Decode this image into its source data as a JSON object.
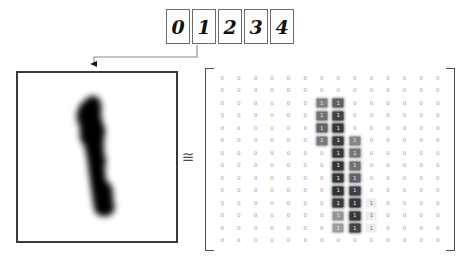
{
  "figure": {
    "approx_symbol": "≅"
  },
  "digit_strip": {
    "name": "digit-samples-strip",
    "digits": [
      {
        "label": "0",
        "selected": false
      },
      {
        "label": "1",
        "selected": true
      },
      {
        "label": "2",
        "selected": false
      },
      {
        "label": "3",
        "selected": false
      },
      {
        "label": "4",
        "selected": false
      }
    ]
  },
  "image_panel": {
    "name": "enlarged-digit-image",
    "depicted_digit": "1",
    "border_color": "#3a3a3a",
    "background_color": "#ffffff",
    "ink_color": "#000000"
  },
  "matrix": {
    "name": "pixel-intensity-matrix",
    "rows": 14,
    "cols": 14,
    "zero_label": "0",
    "one_label": "1",
    "bracket_color": "#4e4e5a",
    "zero_text_color": "#9a9aa2",
    "values": [
      [
        0,
        0,
        0,
        0,
        0,
        0,
        0,
        0,
        0,
        0,
        0,
        0,
        0,
        0
      ],
      [
        0,
        0,
        0,
        0,
        0,
        0,
        0,
        0,
        0,
        0,
        0,
        0,
        0,
        0
      ],
      [
        0,
        0,
        0,
        0,
        0,
        0,
        0.55,
        0.72,
        0,
        0,
        0,
        0,
        0,
        0
      ],
      [
        0,
        0,
        0,
        0,
        0,
        0,
        0.62,
        0.86,
        0,
        0,
        0,
        0,
        0,
        0
      ],
      [
        0,
        0,
        0,
        0,
        0,
        0,
        0.7,
        0.92,
        0,
        0,
        0,
        0,
        0,
        0
      ],
      [
        0,
        0,
        0,
        0,
        0,
        0,
        0.58,
        0.9,
        0.52,
        0,
        0,
        0,
        0,
        0
      ],
      [
        0,
        0,
        0,
        0,
        0,
        0,
        0,
        0.92,
        0.6,
        0,
        0,
        0,
        0,
        0
      ],
      [
        0,
        0,
        0,
        0,
        0,
        0,
        0,
        0.94,
        0.62,
        0,
        0,
        0,
        0,
        0
      ],
      [
        0,
        0,
        0,
        0,
        0,
        0,
        0,
        0.93,
        0.7,
        0,
        0,
        0,
        0,
        0
      ],
      [
        0,
        0,
        0,
        0,
        0,
        0,
        0,
        0.95,
        0.88,
        0,
        0,
        0,
        0,
        0
      ],
      [
        0,
        0,
        0,
        0,
        0,
        0,
        0,
        0.9,
        0.93,
        1,
        0,
        0,
        0,
        0
      ],
      [
        0,
        0,
        0,
        0,
        0,
        0,
        0,
        0.45,
        0.92,
        1,
        0,
        0,
        0,
        0
      ],
      [
        0,
        0,
        0,
        0,
        0,
        0,
        0,
        0.4,
        0.85,
        1,
        0,
        0,
        0,
        0
      ],
      [
        0,
        0,
        0,
        0,
        0,
        0,
        0,
        0,
        0,
        0,
        0,
        0,
        0,
        0
      ]
    ]
  },
  "connector": {
    "name": "selection-arrow",
    "color": "#707070",
    "from": "selected digit cell",
    "to": "enlarged image box"
  }
}
